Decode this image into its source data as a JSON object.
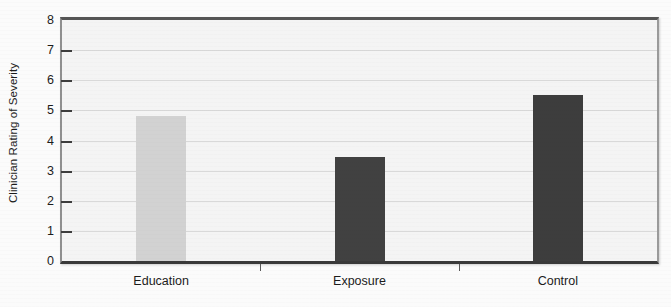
{
  "chart_data": {
    "type": "bar",
    "title": "",
    "xlabel": "",
    "ylabel": "Clinician Rating of Severity",
    "categories": [
      "Education",
      "Exposure",
      "Control"
    ],
    "values": [
      4.8,
      3.45,
      5.5
    ],
    "ylim": [
      0,
      8
    ],
    "ytick_labels": [
      "0",
      "1",
      "2",
      "3",
      "4",
      "5",
      "6",
      "7",
      "8"
    ],
    "ytick_values": [
      0,
      1,
      2,
      3,
      4,
      5,
      6,
      7,
      8
    ],
    "grid": true,
    "legend": "none",
    "bar_colors": [
      "#d2d2d2",
      "#414141",
      "#3d3d3d"
    ],
    "plot_background": "#f4f4f4"
  }
}
